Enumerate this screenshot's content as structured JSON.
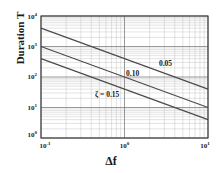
{
  "chart_data": {
    "type": "line",
    "title": "",
    "xlabel": "Δf",
    "ylabel": "Duration T",
    "xscale": "log",
    "yscale": "log",
    "xlim": [
      0.1,
      10
    ],
    "ylim": [
      1,
      10000
    ],
    "grid": true,
    "legend": "inline-annotations",
    "xtick_labels": [
      "10⁻¹",
      "10⁰",
      "10¹"
    ],
    "xtick_values": [
      0.1,
      1,
      10
    ],
    "ytick_labels": [
      "10⁰",
      "10¹",
      "10²",
      "10³",
      "10⁴"
    ],
    "ytick_values": [
      1,
      10,
      100,
      1000,
      10000
    ],
    "series": [
      {
        "name": "0.05",
        "label": "0.05",
        "x": [
          0.1,
          10
        ],
        "y": [
          4000,
          40
        ],
        "slope": -1
      },
      {
        "name": "0.10",
        "label": "0.10",
        "x": [
          0.1,
          10
        ],
        "y": [
          1000,
          10
        ],
        "slope": -1
      },
      {
        "name": "0.15",
        "label": "ζ = 0.15",
        "x": [
          0.1,
          10
        ],
        "y": [
          400,
          4
        ],
        "slope": -1
      }
    ],
    "annotations": [
      {
        "text": "0.05",
        "x": 3.1,
        "y": 230
      },
      {
        "text": "0.10",
        "x": 1.25,
        "y": 105
      },
      {
        "text": "ζ = 0.15",
        "x": 0.62,
        "y": 22
      }
    ]
  },
  "axis": {
    "x_tick_left": {
      "mantissa": "10",
      "exponent": "-1"
    },
    "x_tick_mid": {
      "mantissa": "10",
      "exponent": "0"
    },
    "x_tick_right": {
      "mantissa": "10",
      "exponent": "1"
    },
    "y_tick_4": {
      "mantissa": "10",
      "exponent": "4"
    },
    "y_tick_3": {
      "mantissa": "10",
      "exponent": "3"
    },
    "y_tick_2": {
      "mantissa": "10",
      "exponent": "2"
    },
    "y_tick_1": {
      "mantissa": "10",
      "exponent": "1"
    },
    "y_tick_0": {
      "mantissa": "10",
      "exponent": "0"
    }
  },
  "labels": {
    "y_axis_title": "Duration T",
    "x_axis_title": "Δf"
  },
  "colors": {
    "curve": "#4a4a4a",
    "grid_minor": "#b9b9b9",
    "grid_major": "#6e6e6e",
    "frame": "#3a3a3a",
    "text": "#1a1a1a",
    "background": "#ffffff"
  }
}
